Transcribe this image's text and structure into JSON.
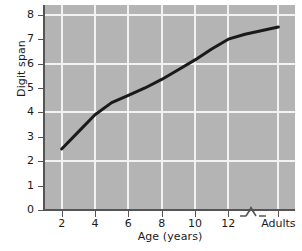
{
  "chart_data": {
    "type": "line",
    "title": "",
    "xlabel": "Age (years)",
    "ylabel": "Digit span",
    "x_tick_labels": [
      "2",
      "4",
      "6",
      "8",
      "10",
      "12",
      "Adults"
    ],
    "x_tick_values": [
      2,
      4,
      6,
      8,
      10,
      12,
      15
    ],
    "y_tick_labels": [
      "0",
      "1",
      "2",
      "3",
      "4",
      "5",
      "6",
      "7",
      "8"
    ],
    "y_tick_values": [
      0,
      1,
      2,
      3,
      4,
      5,
      6,
      7,
      8
    ],
    "xlim": [
      1,
      16
    ],
    "ylim": [
      0,
      8.4
    ],
    "grid": "both-axes-white-gridlines",
    "grid_x_values": [
      2,
      4,
      6,
      8,
      10,
      12,
      15
    ],
    "grid_y_values": [
      2,
      4,
      6,
      8
    ],
    "legend": "none",
    "axis_break": {
      "present": true,
      "axis": "x",
      "between_labels": [
        "12",
        "Adults"
      ],
      "symbol": "zigzag"
    },
    "series": [
      {
        "name": "Digit span",
        "color": "#1a1a1a",
        "line_width": 3,
        "x": [
          2,
          3,
          4,
          5,
          6,
          7,
          8,
          9,
          10,
          11,
          12,
          13,
          15
        ],
        "x_labels": [
          "2",
          "3",
          "4",
          "5",
          "6",
          "7",
          "8",
          "9",
          "10",
          "11",
          "12",
          "13",
          "Adults"
        ],
        "values": [
          2.5,
          3.2,
          3.9,
          4.4,
          4.7,
          5.0,
          5.35,
          5.75,
          6.15,
          6.6,
          7.0,
          7.2,
          7.5
        ]
      }
    ],
    "colors": {
      "plot_background": "#b4b4b4",
      "gridline": "#f2f2f2",
      "axis": "#555555",
      "line": "#1a1a1a",
      "text": "#1a1a1a",
      "figure_background": "#ffffff"
    }
  }
}
